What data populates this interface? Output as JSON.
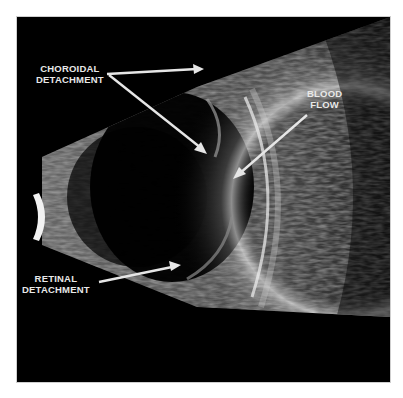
{
  "figure": {
    "type": "ocular B-scan ultrasound",
    "background_color": "#000000",
    "label_color": "#e8e8e8",
    "arrow_color": "#e6e6e6"
  },
  "labels": [
    {
      "id": "choroidal",
      "lines": [
        "CHOROIDAL",
        "DETACHMENT"
      ],
      "arrows": 2
    },
    {
      "id": "blood",
      "lines": [
        "BLOOD",
        "FLOW"
      ],
      "arrows": 1
    },
    {
      "id": "retinal",
      "lines": [
        "RETINAL",
        "DETACHMENT"
      ],
      "arrows": 1
    }
  ]
}
